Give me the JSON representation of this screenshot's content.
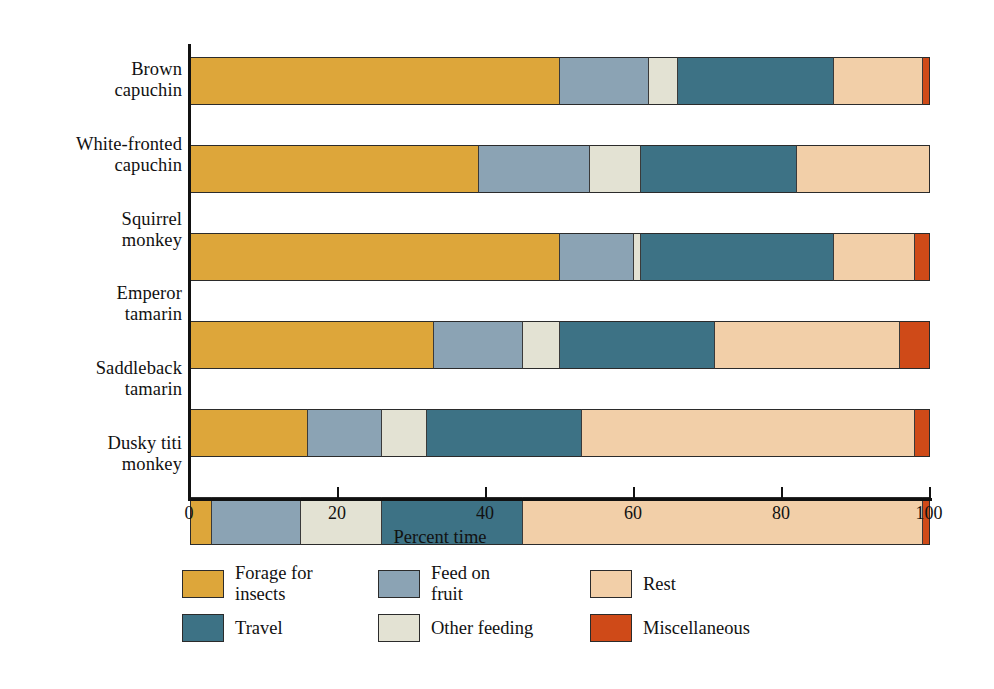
{
  "chart_data": {
    "type": "bar",
    "orientation": "horizontal",
    "stacked": true,
    "title": "",
    "xlabel": "Percent time",
    "ylabel": "",
    "xlim": [
      0,
      100
    ],
    "xticks": [
      0,
      20,
      40,
      60,
      80,
      100
    ],
    "grid": false,
    "legend_position": "bottom",
    "categories": [
      "Brown capuchin",
      "White-fronted capuchin",
      "Squirrel monkey",
      "Emperor tamarin",
      "Saddleback tamarin",
      "Dusky titi monkey"
    ],
    "series": [
      {
        "name": "Forage for insects",
        "color": "#dda63a",
        "values": [
          50,
          39,
          50,
          33,
          16,
          3
        ]
      },
      {
        "name": "Feed on fruit",
        "color": "#8ba3b4",
        "values": [
          12,
          15,
          10,
          12,
          10,
          12
        ]
      },
      {
        "name": "Other feeding",
        "color": "#e3e2d3",
        "values": [
          4,
          7,
          1,
          5,
          6,
          11
        ]
      },
      {
        "name": "Travel",
        "color": "#3d7285",
        "values": [
          21,
          21,
          26,
          21,
          21,
          19
        ]
      },
      {
        "name": "Rest",
        "color": "#f2cfa8",
        "values": [
          12,
          18,
          11,
          25,
          45,
          54
        ]
      },
      {
        "name": "Miscellaneous",
        "color": "#cf4a18",
        "values": [
          1,
          0,
          2,
          4,
          2,
          1
        ]
      }
    ]
  },
  "axis": {
    "x_title": "Percent time",
    "tick_labels": [
      "0",
      "20",
      "40",
      "60",
      "80",
      "100"
    ]
  },
  "category_labels": [
    {
      "line1": "Brown",
      "line2": "capuchin"
    },
    {
      "line1": "White-fronted",
      "line2": "capuchin"
    },
    {
      "line1": "Squirrel",
      "line2": "monkey"
    },
    {
      "line1": "Emperor",
      "line2": "tamarin"
    },
    {
      "line1": "Saddleback",
      "line2": "tamarin"
    },
    {
      "line1": "Dusky titi",
      "line2": "monkey"
    }
  ],
  "legend": {
    "items": [
      {
        "label": "Forage for insects",
        "line1": "Forage for",
        "line2": "insects",
        "color": "#dda63a"
      },
      {
        "label": "Feed on fruit",
        "line1": "Feed on",
        "line2": "fruit",
        "color": "#8ba3b4"
      },
      {
        "label": "Rest",
        "line1": "Rest",
        "line2": "",
        "color": "#f2cfa8"
      },
      {
        "label": "Travel",
        "line1": "Travel",
        "line2": "",
        "color": "#3d7285"
      },
      {
        "label": "Other feeding",
        "line1": "Other feeding",
        "line2": "",
        "color": "#e3e2d3"
      },
      {
        "label": "Miscellaneous",
        "line1": "Miscellaneous",
        "line2": "",
        "color": "#cf4a18"
      }
    ]
  }
}
